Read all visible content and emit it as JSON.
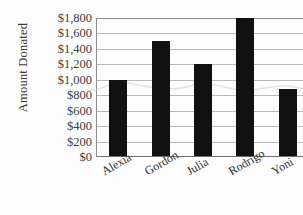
{
  "chart_data": {
    "type": "bar",
    "title": "",
    "title_fragment_visible": "cropped at top edge",
    "xlabel": "",
    "ylabel": "Amount Donated",
    "categories": [
      "Alexia",
      "Gordon",
      "Julia",
      "Rodrigo",
      "Yoni"
    ],
    "values": [
      1000,
      1500,
      1200,
      1800,
      880
    ],
    "ylim": [
      0,
      1800
    ],
    "ytick_step": 200,
    "ytick_labels": [
      "$1,800",
      "$1,600",
      "$1,400",
      "$1,200",
      "$1,000",
      "$800",
      "$600",
      "$400",
      "$200",
      "$0"
    ],
    "ytick_values": [
      1800,
      1600,
      1400,
      1200,
      1000,
      800,
      600,
      400,
      200,
      0
    ],
    "grid": true,
    "legend": false,
    "legend_position": "none",
    "bar_color": "#111111",
    "gridline_color": "#b9b9b9",
    "axis_color": "#8d8d8d",
    "text_color": "#3d3d3d",
    "xlabel_rotation_degrees": -30
  },
  "axes": {
    "y_title": "Amount Donated"
  }
}
